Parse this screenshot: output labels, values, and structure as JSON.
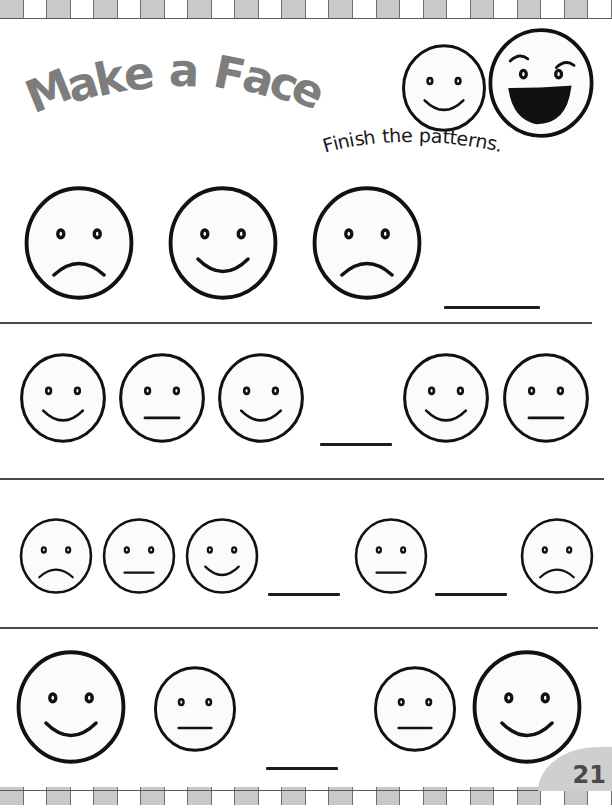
{
  "page": {
    "subtitle": "Finish the patterns.",
    "page_number": "21",
    "title_color": "#7d7d7d",
    "ink_color": "#1c1c1c",
    "border_color": "#c9c9c9"
  },
  "mascots": [
    {
      "name": "mascot-small-smile",
      "expression": "happy",
      "size": 88,
      "x": 400,
      "y": 44
    },
    {
      "name": "mascot-large-laugh",
      "expression": "laughing",
      "size": 110,
      "x": 486,
      "y": 28
    }
  ],
  "rows": [
    {
      "id": "row-1",
      "divider_y": 322,
      "divider_width": 592,
      "items": [
        {
          "type": "face",
          "expression": "sad",
          "size": 114,
          "x": 22,
          "y": 186
        },
        {
          "type": "face",
          "expression": "happy",
          "size": 114,
          "x": 166,
          "y": 186
        },
        {
          "type": "face",
          "expression": "sad",
          "size": 114,
          "x": 310,
          "y": 186
        },
        {
          "type": "blank",
          "x": 444,
          "y": 306,
          "width": 96
        }
      ]
    },
    {
      "id": "row-2",
      "divider_y": 478,
      "divider_width": 604,
      "items": [
        {
          "type": "face",
          "expression": "happy",
          "size": 90,
          "x": 18,
          "y": 353
        },
        {
          "type": "face",
          "expression": "neutral",
          "size": 90,
          "x": 117,
          "y": 353
        },
        {
          "type": "face",
          "expression": "happy",
          "size": 90,
          "x": 216,
          "y": 353
        },
        {
          "type": "blank",
          "x": 320,
          "y": 443,
          "width": 72
        },
        {
          "type": "face",
          "expression": "happy",
          "size": 90,
          "x": 401,
          "y": 353
        },
        {
          "type": "face",
          "expression": "neutral",
          "size": 90,
          "x": 501,
          "y": 353
        }
      ]
    },
    {
      "id": "row-3",
      "divider_y": 627,
      "divider_width": 598,
      "items": [
        {
          "type": "face",
          "expression": "sad",
          "size": 76,
          "x": 18,
          "y": 518
        },
        {
          "type": "face",
          "expression": "neutral",
          "size": 76,
          "x": 101,
          "y": 518
        },
        {
          "type": "face",
          "expression": "happy",
          "size": 76,
          "x": 184,
          "y": 518
        },
        {
          "type": "blank",
          "x": 268,
          "y": 593,
          "width": 72
        },
        {
          "type": "face",
          "expression": "neutral",
          "size": 76,
          "x": 353,
          "y": 518
        },
        {
          "type": "blank",
          "x": 435,
          "y": 593,
          "width": 72
        },
        {
          "type": "face",
          "expression": "sad",
          "size": 76,
          "x": 519,
          "y": 518
        }
      ]
    },
    {
      "id": "row-4",
      "divider_y": null,
      "divider_width": 0,
      "items": [
        {
          "type": "face",
          "expression": "happy",
          "size": 114,
          "x": 14,
          "y": 650
        },
        {
          "type": "face",
          "expression": "neutral",
          "size": 86,
          "x": 152,
          "y": 666
        },
        {
          "type": "blank",
          "x": 266,
          "y": 767,
          "width": 72
        },
        {
          "type": "face",
          "expression": "neutral",
          "size": 86,
          "x": 372,
          "y": 666
        },
        {
          "type": "face",
          "expression": "happy",
          "size": 114,
          "x": 470,
          "y": 650
        }
      ]
    }
  ]
}
